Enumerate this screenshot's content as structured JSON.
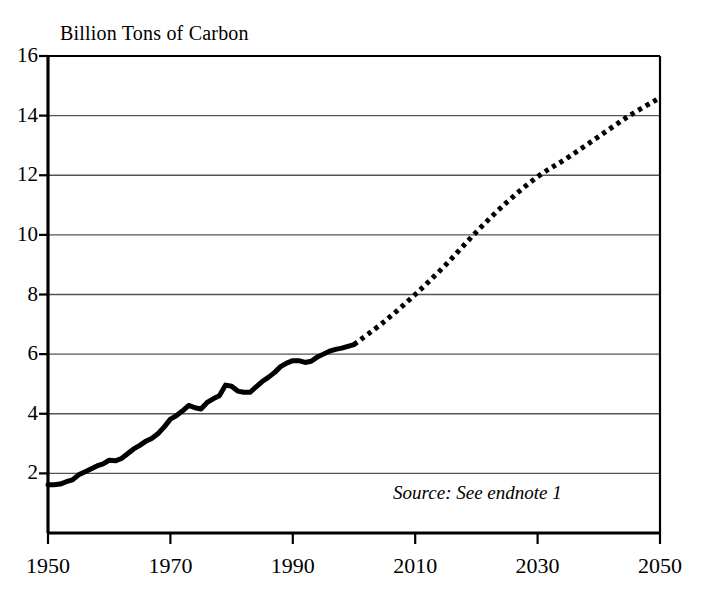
{
  "chart_data": {
    "type": "line",
    "title": "Billion Tons of Carbon",
    "xlabel": "",
    "ylabel": "Billion Tons of Carbon",
    "xlim": [
      1950,
      2050
    ],
    "ylim": [
      0,
      16
    ],
    "grid": true,
    "legend_position": "none",
    "yticks": [
      16,
      14,
      12,
      10,
      8,
      6,
      4,
      2
    ],
    "ytick_labels": [
      "16",
      "14",
      "12",
      "10",
      "8",
      "6",
      "4",
      "2"
    ],
    "xticks": [
      1950,
      1970,
      1990,
      2010,
      2030,
      2050
    ],
    "xtick_labels": [
      "1950",
      "1970",
      "1990",
      "2010",
      "2030",
      "2050"
    ],
    "annotations": [
      {
        "text": "Source: See endnote 1",
        "style": "italic",
        "x": 2026,
        "y": 1.3
      }
    ],
    "series": [
      {
        "name": "Historical carbon emissions",
        "style": "solid",
        "linewidth": 5,
        "color": "#000000",
        "x": [
          1950,
          1951,
          1952,
          1953,
          1954,
          1955,
          1956,
          1957,
          1958,
          1959,
          1960,
          1961,
          1962,
          1963,
          1964,
          1965,
          1966,
          1967,
          1968,
          1969,
          1970,
          1971,
          1972,
          1973,
          1974,
          1975,
          1976,
          1977,
          1978,
          1979,
          1980,
          1981,
          1982,
          1983,
          1984,
          1985,
          1986,
          1987,
          1988,
          1989,
          1990,
          1991,
          1992,
          1993,
          1994,
          1995,
          1996,
          1997,
          1998,
          1999,
          2000
        ],
        "values": [
          1.62,
          1.62,
          1.64,
          1.72,
          1.78,
          1.95,
          2.05,
          2.15,
          2.25,
          2.32,
          2.44,
          2.42,
          2.5,
          2.66,
          2.82,
          2.94,
          3.08,
          3.18,
          3.34,
          3.56,
          3.82,
          3.94,
          4.1,
          4.28,
          4.2,
          4.16,
          4.38,
          4.5,
          4.6,
          4.96,
          4.92,
          4.76,
          4.72,
          4.72,
          4.9,
          5.08,
          5.22,
          5.38,
          5.58,
          5.7,
          5.78,
          5.78,
          5.72,
          5.76,
          5.9,
          6.0,
          6.1,
          6.16,
          6.2,
          6.26,
          6.32
        ]
      },
      {
        "name": "Projected carbon emissions",
        "style": "dotted",
        "linewidth": 5,
        "color": "#000000",
        "x": [
          2000,
          2005,
          2010,
          2015,
          2020,
          2025,
          2030,
          2035,
          2040,
          2045,
          2050
        ],
        "values": [
          6.32,
          7.1,
          8.0,
          9.0,
          10.1,
          11.1,
          11.95,
          12.6,
          13.3,
          14.0,
          14.6
        ]
      }
    ]
  },
  "axes": {
    "frame_color": "#000000",
    "gridline_color": "#555555"
  }
}
